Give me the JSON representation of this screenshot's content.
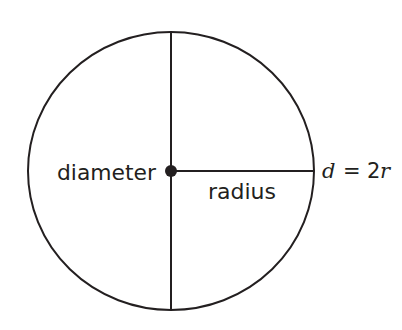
{
  "diagram": {
    "labels": {
      "diameter": "diameter",
      "radius": "radius",
      "formula_d": "d",
      "formula_eq": "=",
      "formula_2": "2",
      "formula_r": "r"
    },
    "colors": {
      "stroke": "#231f20",
      "background": "#ffffff"
    },
    "geometry": {
      "center": [
        171,
        171
      ],
      "rx": 143,
      "ry": 139
    }
  }
}
